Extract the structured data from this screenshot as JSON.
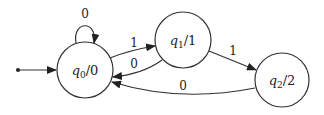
{
  "diagram": {
    "type": "moore-machine-state-diagram",
    "colors": {
      "stroke": "#333333",
      "background": "#ffffff",
      "text": "#222222"
    },
    "initial_arrow": {
      "target": "q0"
    },
    "states": [
      {
        "id": "q0",
        "name": "q",
        "sub": "0",
        "output": "/0",
        "cx": 85,
        "cy": 70,
        "r": 28
      },
      {
        "id": "q1",
        "name": "q",
        "sub": "1",
        "output": "/1",
        "cx": 183,
        "cy": 40,
        "r": 28
      },
      {
        "id": "q2",
        "name": "q",
        "sub": "2",
        "output": "/2",
        "cx": 282,
        "cy": 80,
        "r": 27
      }
    ],
    "transitions": [
      {
        "from": "q0",
        "to": "q0",
        "label": "0"
      },
      {
        "from": "q0",
        "to": "q1",
        "label": "1"
      },
      {
        "from": "q1",
        "to": "q0",
        "label": "0"
      },
      {
        "from": "q1",
        "to": "q2",
        "label": "1"
      },
      {
        "from": "q2",
        "to": "q0",
        "label": "0"
      }
    ]
  }
}
